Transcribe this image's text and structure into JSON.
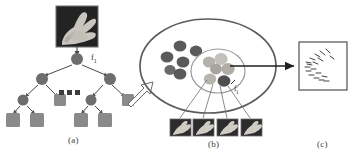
{
  "figure": {
    "background_color": "#ffffff",
    "ink_color": "#4a4a4a",
    "node_fill": "#6e6e6e",
    "leaf_fill": "#8a8a8a",
    "cluster_dark": "#5a5a5a",
    "cluster_light": "#b9b9b9"
  },
  "panels": [
    {
      "id": "a",
      "label": "(a)",
      "caption_x": 68,
      "caption_y": 135
    },
    {
      "id": "b",
      "label": "(b)",
      "caption_x": 208,
      "caption_y": 139
    },
    {
      "id": "c",
      "label": "(c)",
      "caption_x": 317,
      "caption_y": 139
    }
  ],
  "panel_a": {
    "source_image_alt": "hand-gesture-photo",
    "root_label": "f",
    "root_label_sub": "1",
    "ellipsis_label": "...",
    "tree": {
      "levels": 4,
      "internal_node_shape": "circle",
      "leaf_node_shape": "square",
      "internal_node_count": 7,
      "leaf_node_count": 8
    }
  },
  "panel_b": {
    "outer_shape": "ellipse",
    "inner_shape": "ellipse",
    "outer_dot_count": 6,
    "inner_dot_count": 6,
    "highlight_label": "f",
    "highlight_label_sub": "i",
    "thumbnail_count": 4,
    "thumbnail_alt": "hand-gesture-patch"
  },
  "panel_c": {
    "box_alt": "feature-sketch-box",
    "tick_mark_count": 18
  },
  "arrows": {
    "block_arrow_alt": "hollow-block-arrow-a-to-b",
    "solid_arrow_alt": "solid-arrow-b-to-c",
    "image_to_root_alt": "image-to-root-arrow"
  }
}
